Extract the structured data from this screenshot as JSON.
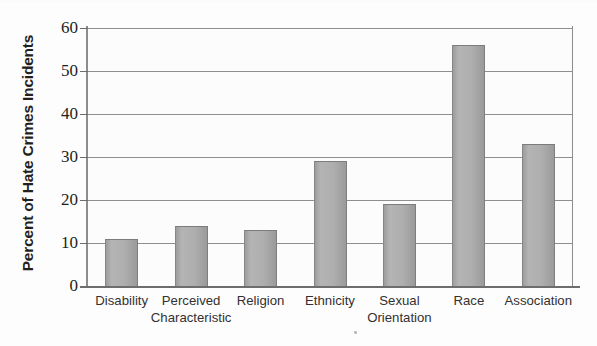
{
  "chart_data": {
    "type": "bar",
    "title": "",
    "xlabel": "",
    "ylabel": "Percent of Hate Crimes Incidents",
    "categories": [
      "Disability",
      "Perceived\nCharacteristic",
      "Religion",
      "Ethnicity",
      "Sexual\nOrientation",
      "Race",
      "Association"
    ],
    "values": [
      11,
      14,
      13,
      29,
      19,
      56,
      33
    ],
    "ylim": [
      0,
      60
    ],
    "yticks": [
      0,
      10,
      20,
      30,
      40,
      50,
      60
    ],
    "ytick_labels": [
      "0",
      "10",
      "20",
      "30",
      "40",
      "50",
      "60"
    ],
    "grid": true,
    "legend": "none",
    "bar_color": "#adadad",
    "bar_edge_color": "#7c7c7c",
    "axis_color": "#6d6d6d",
    "grid_color": "#8f8f8f",
    "text_color": "#231f20"
  },
  "axis": {
    "y_title": "Percent of Hate Crimes Incidents"
  }
}
